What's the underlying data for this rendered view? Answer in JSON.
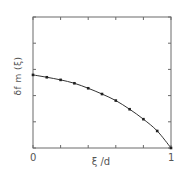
{
  "chart_data": {
    "type": "line",
    "title": "",
    "xlabel": "ξ /d",
    "ylabel": "δf m (ξ)",
    "xlim": [
      0,
      1
    ],
    "ylim": [
      0,
      5
    ],
    "x_tick_labels": [
      "0",
      "1"
    ],
    "x_ticks": [
      0,
      0.2,
      0.4,
      0.6,
      0.8,
      1.0
    ],
    "y_ticks": [
      0,
      1,
      2,
      3,
      4,
      5
    ],
    "y_tick_labels": [],
    "grid": false,
    "legend": null,
    "series": [
      {
        "name": "δf m (ξ)",
        "marker": "square",
        "line": "solid",
        "x": [
          0.0,
          0.1,
          0.2,
          0.3,
          0.4,
          0.5,
          0.6,
          0.7,
          0.8,
          0.9,
          1.0
        ],
        "y": [
          2.79,
          2.7,
          2.6,
          2.47,
          2.28,
          2.06,
          1.81,
          1.48,
          1.1,
          0.65,
          0.0
        ]
      }
    ]
  },
  "colors": {
    "axis": "#6a6a6a",
    "line": "#333333",
    "marker": "#222222"
  }
}
